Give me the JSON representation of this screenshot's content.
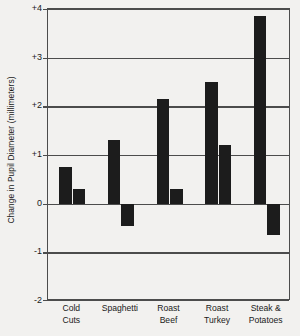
{
  "chart_data": {
    "type": "bar",
    "title": "",
    "xlabel": "",
    "ylabel": "Change in Pupil Diameter (millimeters)",
    "categories": [
      "Cold\nCuts",
      "Spaghetti",
      "Roast\nBeef",
      "Roast\nTurkey",
      "Steak &\nPotatoes"
    ],
    "series": [
      {
        "name": "bar-1",
        "values": [
          0.75,
          1.3,
          2.15,
          2.5,
          3.85
        ]
      },
      {
        "name": "bar-2",
        "values": [
          0.3,
          -0.45,
          0.3,
          1.2,
          -0.65
        ]
      }
    ],
    "ylim": [
      -2,
      4
    ],
    "ytick_values": [
      4,
      3,
      2,
      1,
      0,
      -1,
      -2
    ],
    "ytick_labels": [
      "+4",
      "+3",
      "+2",
      "+1",
      "0",
      "-1",
      "-2"
    ],
    "grid": true,
    "gridlines_at": [
      4,
      3,
      2,
      1,
      0,
      -1,
      -2
    ],
    "legend": "none",
    "bar_color": "#1c1c1c",
    "axis_color": "#4c4c4c",
    "background_color": "#f2f1ef"
  }
}
